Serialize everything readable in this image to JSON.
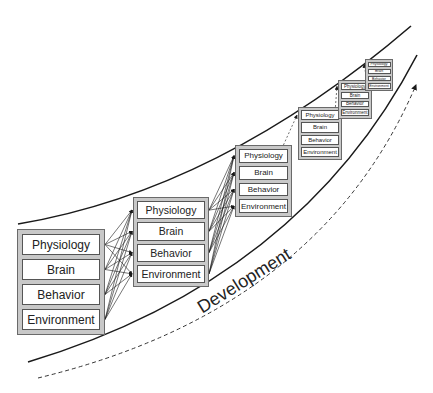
{
  "diagram": {
    "axis_label": "Development",
    "row_labels": [
      "Physiology",
      "Brain",
      "Behavior",
      "Environment"
    ],
    "stages": [
      {
        "x": 17,
        "y": 229,
        "w": 88,
        "h": 106,
        "font": 12,
        "pad": 4
      },
      {
        "x": 133,
        "y": 197,
        "w": 76,
        "h": 90,
        "font": 10.5,
        "pad": 3
      },
      {
        "x": 235,
        "y": 145,
        "w": 57,
        "h": 72,
        "font": 8,
        "pad": 3
      },
      {
        "x": 298,
        "y": 107,
        "w": 44,
        "h": 53,
        "font": 6,
        "pad": 2
      },
      {
        "x": 338,
        "y": 80,
        "w": 34,
        "h": 39,
        "font": 4.5,
        "pad": 2
      },
      {
        "x": 365,
        "y": 59,
        "w": 28,
        "h": 32,
        "font": 3.5,
        "pad": 1.5
      }
    ],
    "colors": {
      "line": "#1a1a1a",
      "box_fill": "#c8c8c8",
      "cell_fill": "#ffffff"
    }
  }
}
